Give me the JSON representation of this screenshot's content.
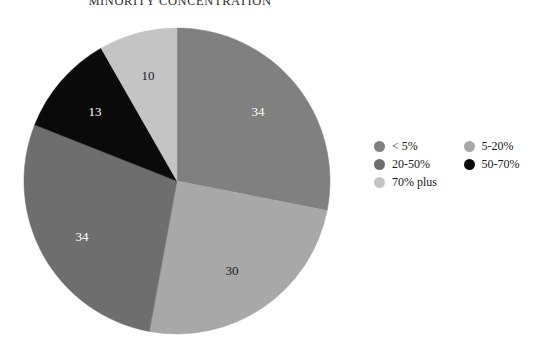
{
  "chart_data": {
    "type": "pie",
    "title": "MINORITY CONCENTRATION",
    "xlabel": "",
    "ylabel": "",
    "legend_position": "right",
    "grid": false,
    "total": 121,
    "categories": [
      "< 5%",
      "5-20%",
      "20-50%",
      "50-70%",
      "70% plus"
    ],
    "values": [
      34,
      30,
      34,
      13,
      10
    ],
    "colors": [
      "#808080",
      "#a8a8a8",
      "#6e6e6e",
      "#0a0a0a",
      "#c4c4c4"
    ],
    "slices": [
      {
        "label": "< 5%",
        "value": 34,
        "display_value": "34",
        "color": "#808080",
        "label_color": "#ffffff",
        "label_x": 258,
        "label_y": 113
      },
      {
        "label": "5-20%",
        "value": 30,
        "display_value": "30",
        "color": "#a8a8a8",
        "label_color": "#1a1a1a",
        "label_x": 232,
        "label_y": 272
      },
      {
        "label": "20-50%",
        "value": 34,
        "display_value": "34",
        "color": "#6e6e6e",
        "label_color": "#ffffff",
        "label_x": 82,
        "label_y": 238
      },
      {
        "label": "50-70%",
        "value": 13,
        "display_value": "13",
        "color": "#0a0a0a",
        "label_color": "#ffffff",
        "label_x": 95,
        "label_y": 113
      },
      {
        "label": "70% plus",
        "value": 10,
        "display_value": "10",
        "color": "#c4c4c4",
        "label_color": "#1a1a1a",
        "label_x": 148,
        "label_y": 77
      }
    ],
    "geometry": {
      "center_x": 177,
      "center_y": 181,
      "radius": 153,
      "start_angle_deg": 0
    }
  },
  "legend": {
    "entries": [
      {
        "label": "< 5%",
        "color": "#808080"
      },
      {
        "label": "5-20%",
        "color": "#a8a8a8"
      },
      {
        "label": "20-50%",
        "color": "#6e6e6e"
      },
      {
        "label": "50-70%",
        "color": "#0a0a0a"
      },
      {
        "label": "70% plus",
        "color": "#c4c4c4"
      }
    ]
  }
}
